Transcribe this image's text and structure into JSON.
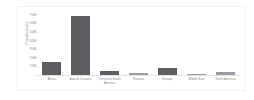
{
  "chart_data": {
    "type": "bar",
    "title": "",
    "subtitle": "",
    "xlabel": "",
    "ylabel": "Population (m)",
    "categories": [
      "Africa",
      "Asia & Oceania",
      "Central & South America",
      "Eurasia",
      "Europe",
      "Middle East",
      "North America"
    ],
    "values": [
      15,
      69,
      5,
      2.5,
      8,
      1.5,
      4
    ],
    "bar_colors": [
      "#5d5d62",
      "#5d5d62",
      "#5d5d62",
      "#9a9aa0",
      "#5d5d62",
      "#9a9aa0",
      "#9a9aa0"
    ],
    "ylim": [
      0,
      72
    ],
    "yticks": [
      10,
      20,
      30,
      40,
      50,
      60,
      70
    ],
    "ytick_labels": [
      "10M",
      "20M",
      "30M",
      "40M",
      "50M",
      "60M",
      "70M"
    ],
    "grid": false,
    "legend": null,
    "legend_position": "none"
  },
  "style": {
    "frame_border_color": "#f2f2f4",
    "axis_text_color": "#8d8d93",
    "baseline_color": "#e2e2e6",
    "background": "#ffffff"
  }
}
